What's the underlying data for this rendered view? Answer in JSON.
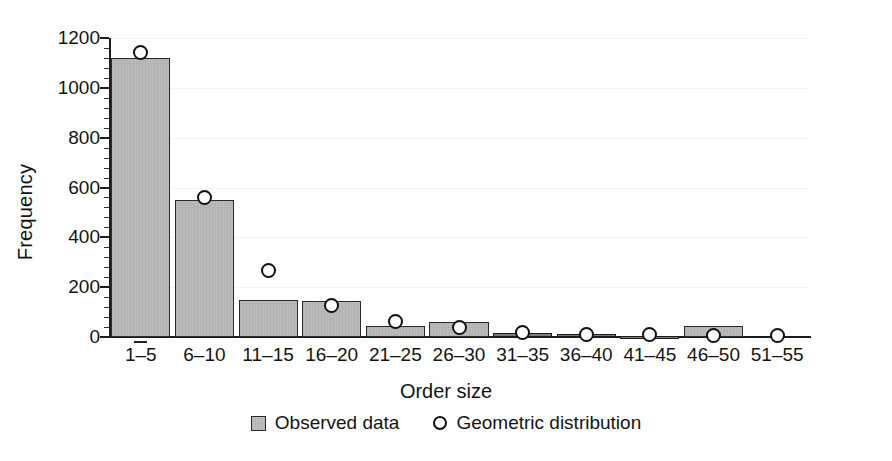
{
  "chart_data": {
    "type": "bar",
    "title": "",
    "xlabel": "Order size",
    "ylabel": "Frequency",
    "ylim": [
      0,
      1200
    ],
    "yticks": [
      0,
      200,
      400,
      600,
      800,
      1000,
      1200
    ],
    "ytick_labels": [
      "0",
      "200",
      "400",
      "600",
      "800",
      "1000",
      "1200"
    ],
    "minor_ticks_per_interval": 4,
    "grid": true,
    "grid_axis": "y",
    "legend_position": "bottom-center",
    "categories": [
      "1–5",
      "6–10",
      "11–15",
      "16–20",
      "21–25",
      "26–30",
      "31–35",
      "36–40",
      "41–45",
      "46–50",
      "51–55"
    ],
    "series": [
      {
        "name": "Observed data",
        "type": "bar",
        "color": "#bdbdbd",
        "edge_color": "#2b2b2b",
        "values": [
          1120,
          548,
          148,
          145,
          45,
          62,
          18,
          12,
          5,
          45,
          0
        ]
      },
      {
        "name": "Geometric distribution",
        "type": "scatter",
        "marker": "open-circle",
        "color": "#ffffff",
        "edge_color": "#111111",
        "values": [
          1140,
          560,
          265,
          128,
          62,
          38,
          20,
          12,
          10,
          8,
          5
        ]
      }
    ]
  },
  "axes": {
    "y_title": "Frequency",
    "x_title": "Order size"
  },
  "legend": {
    "items": [
      {
        "label": "Observed data",
        "marker": "square-swatch"
      },
      {
        "label": "Geometric distribution",
        "marker": "open-circle"
      }
    ]
  }
}
